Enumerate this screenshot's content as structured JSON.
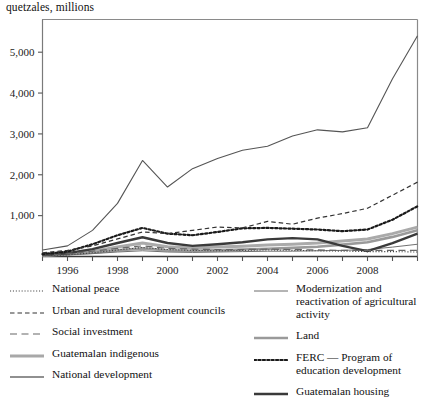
{
  "chart_data": {
    "type": "line",
    "title": "",
    "ylabel": "quetzales, millions",
    "xlabel": "",
    "ylim": [
      0,
      5800
    ],
    "yticks": [
      1000,
      2000,
      3000,
      4000,
      5000
    ],
    "ytick_labels": [
      "1,000",
      "2,000",
      "3,000",
      "4,000",
      "5,000"
    ],
    "xlim": [
      1995,
      2010
    ],
    "x": [
      1995,
      1996,
      1997,
      1998,
      1999,
      2000,
      2001,
      2002,
      2003,
      2004,
      2005,
      2006,
      2007,
      2008,
      2009,
      2010
    ],
    "xticks": [
      1995,
      1996,
      1997,
      1998,
      1999,
      2000,
      2001,
      2002,
      2003,
      2004,
      2005,
      2006,
      2007,
      2008,
      2009,
      2010
    ],
    "xtick_labels": [
      "",
      "1996",
      "",
      "1998",
      "",
      "2000",
      "",
      "2002",
      "",
      "2004",
      "",
      "2006",
      "",
      "2008",
      "",
      ""
    ],
    "grid": false,
    "legend_position": "below",
    "series": [
      {
        "name": "National development",
        "style": "solid-thin-dark",
        "color": "#555555",
        "values": [
          160,
          260,
          640,
          1300,
          2350,
          1700,
          2150,
          2400,
          2600,
          2700,
          2950,
          3100,
          3050,
          3150,
          4350,
          5400
        ]
      },
      {
        "name": "Urban and rural development councils",
        "style": "dashed",
        "color": "#333333",
        "values": [
          90,
          150,
          260,
          430,
          600,
          560,
          640,
          720,
          700,
          860,
          790,
          940,
          1050,
          1180,
          1500,
          1820
        ]
      },
      {
        "name": "FERC — Program of education development",
        "style": "dotted-bold",
        "color": "#1a1a1a",
        "values": [
          60,
          120,
          300,
          520,
          700,
          560,
          520,
          600,
          690,
          700,
          680,
          660,
          620,
          660,
          900,
          1230
        ]
      },
      {
        "name": "National peace",
        "style": "dotted-fine",
        "color": "#444444",
        "values": [
          20,
          40,
          90,
          160,
          220,
          170,
          150,
          140,
          150,
          160,
          150,
          140,
          130,
          120,
          120,
          110
        ]
      },
      {
        "name": "Social investment",
        "style": "longdash",
        "color": "#666666",
        "values": [
          40,
          70,
          130,
          200,
          260,
          200,
          180,
          170,
          170,
          180,
          170,
          160,
          150,
          150,
          150,
          150
        ]
      },
      {
        "name": "Guatemalan indigenous",
        "style": "solid-thick-lightgray",
        "color": "#aaaaaa",
        "values": [
          30,
          60,
          120,
          230,
          330,
          240,
          210,
          230,
          250,
          280,
          300,
          330,
          380,
          430,
          560,
          720
        ]
      },
      {
        "name": "Guatemalan housing",
        "style": "solid-thick-dark",
        "color": "#3a3a3a",
        "values": [
          40,
          80,
          180,
          330,
          470,
          330,
          260,
          300,
          350,
          420,
          450,
          420,
          260,
          130,
          330,
          560
        ]
      },
      {
        "name": "Modernization and reactivation of agricultural activity",
        "style": "solid-thin-gray",
        "color": "#707070",
        "values": [
          20,
          40,
          70,
          110,
          140,
          110,
          100,
          110,
          120,
          130,
          130,
          140,
          150,
          170,
          230,
          300
        ]
      },
      {
        "name": "Land",
        "style": "solid-med-gray",
        "color": "#9a9a9a",
        "values": [
          25,
          50,
          90,
          150,
          200,
          150,
          140,
          150,
          170,
          190,
          210,
          240,
          290,
          350,
          480,
          640
        ]
      }
    ]
  },
  "legend": {
    "left_items": [
      {
        "label": "National peace",
        "swatch": "dotted-fine"
      },
      {
        "label": "Urban and rural development councils",
        "swatch": "dashed"
      },
      {
        "label": "Social investment",
        "swatch": "longdash"
      },
      {
        "label": "Guatemalan indigenous",
        "swatch": "solid-thick-lightgray"
      },
      {
        "label": "National development",
        "swatch": "solid-thin-dark"
      }
    ],
    "right_items": [
      {
        "label": "Modernization and reactivation of agricultural activity",
        "swatch": "solid-thin-gray"
      },
      {
        "label": "Land",
        "swatch": "solid-med-gray"
      },
      {
        "label": "FERC — Program of education development",
        "swatch": "dotted-bold"
      },
      {
        "label": "Guatemalan housing",
        "swatch": "solid-thick-dark"
      }
    ]
  }
}
